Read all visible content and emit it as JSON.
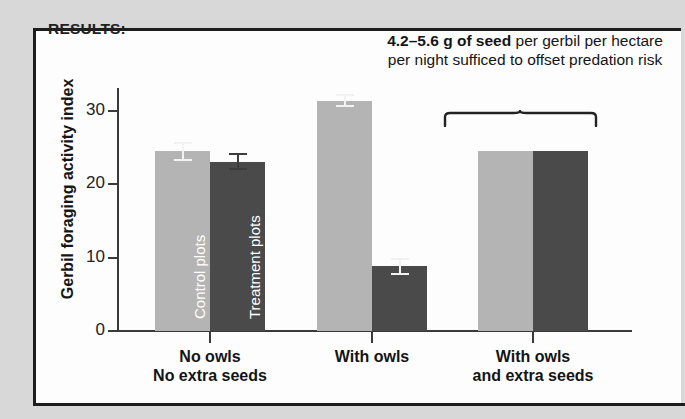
{
  "panel": {
    "results_label": "RESULTS:"
  },
  "annotation": {
    "bold_part": "4.2–5.6 g of seed",
    "rest": " per gerbil per hectare per night sufficed to offset predation risk",
    "brace_name": "curly-brace"
  },
  "chart_data": {
    "type": "bar",
    "title": "",
    "xlabel": "",
    "ylabel": "Gerbil foraging activity index",
    "ylim": [
      0,
      33
    ],
    "yticks": [
      0,
      10,
      20,
      30
    ],
    "ytick_labels": [
      "0",
      "10",
      "20",
      "30"
    ],
    "grid": false,
    "legend_position": "in-bar",
    "categories": [
      "No owls\nNo extra seeds",
      "With owls",
      "With owls\nand extra seeds"
    ],
    "category_lines": [
      [
        "No owls",
        "No extra seeds"
      ],
      [
        "With owls",
        ""
      ],
      [
        "With owls",
        "and extra seeds"
      ]
    ],
    "series": [
      {
        "name": "Control plots",
        "color": "#b4b4b4",
        "values": [
          24.5,
          31.4,
          24.6
        ],
        "errors": [
          1.3,
          0.9,
          null
        ]
      },
      {
        "name": "Treatment plots",
        "color": "#4a4a4a",
        "values": [
          23.1,
          8.8,
          24.6
        ],
        "errors": [
          1.2,
          1.1,
          null
        ]
      }
    ],
    "in_bar_labels": [
      "Control plots",
      "Treatment plots"
    ],
    "annotations": [
      {
        "text": "4.2–5.6 g of seed per gerbil per hectare per night sufficed to offset predation risk",
        "target_category": "With owls and extra seeds"
      }
    ]
  },
  "colors": {
    "light_bar": "#b4b4b4",
    "dark_bar": "#4a4a4a",
    "axis": "#3a3a3a",
    "text": "#151515",
    "panel_bg": "#fdfdfd",
    "page_bg": "#d8d8d8",
    "frame": "#1d1d1d"
  }
}
